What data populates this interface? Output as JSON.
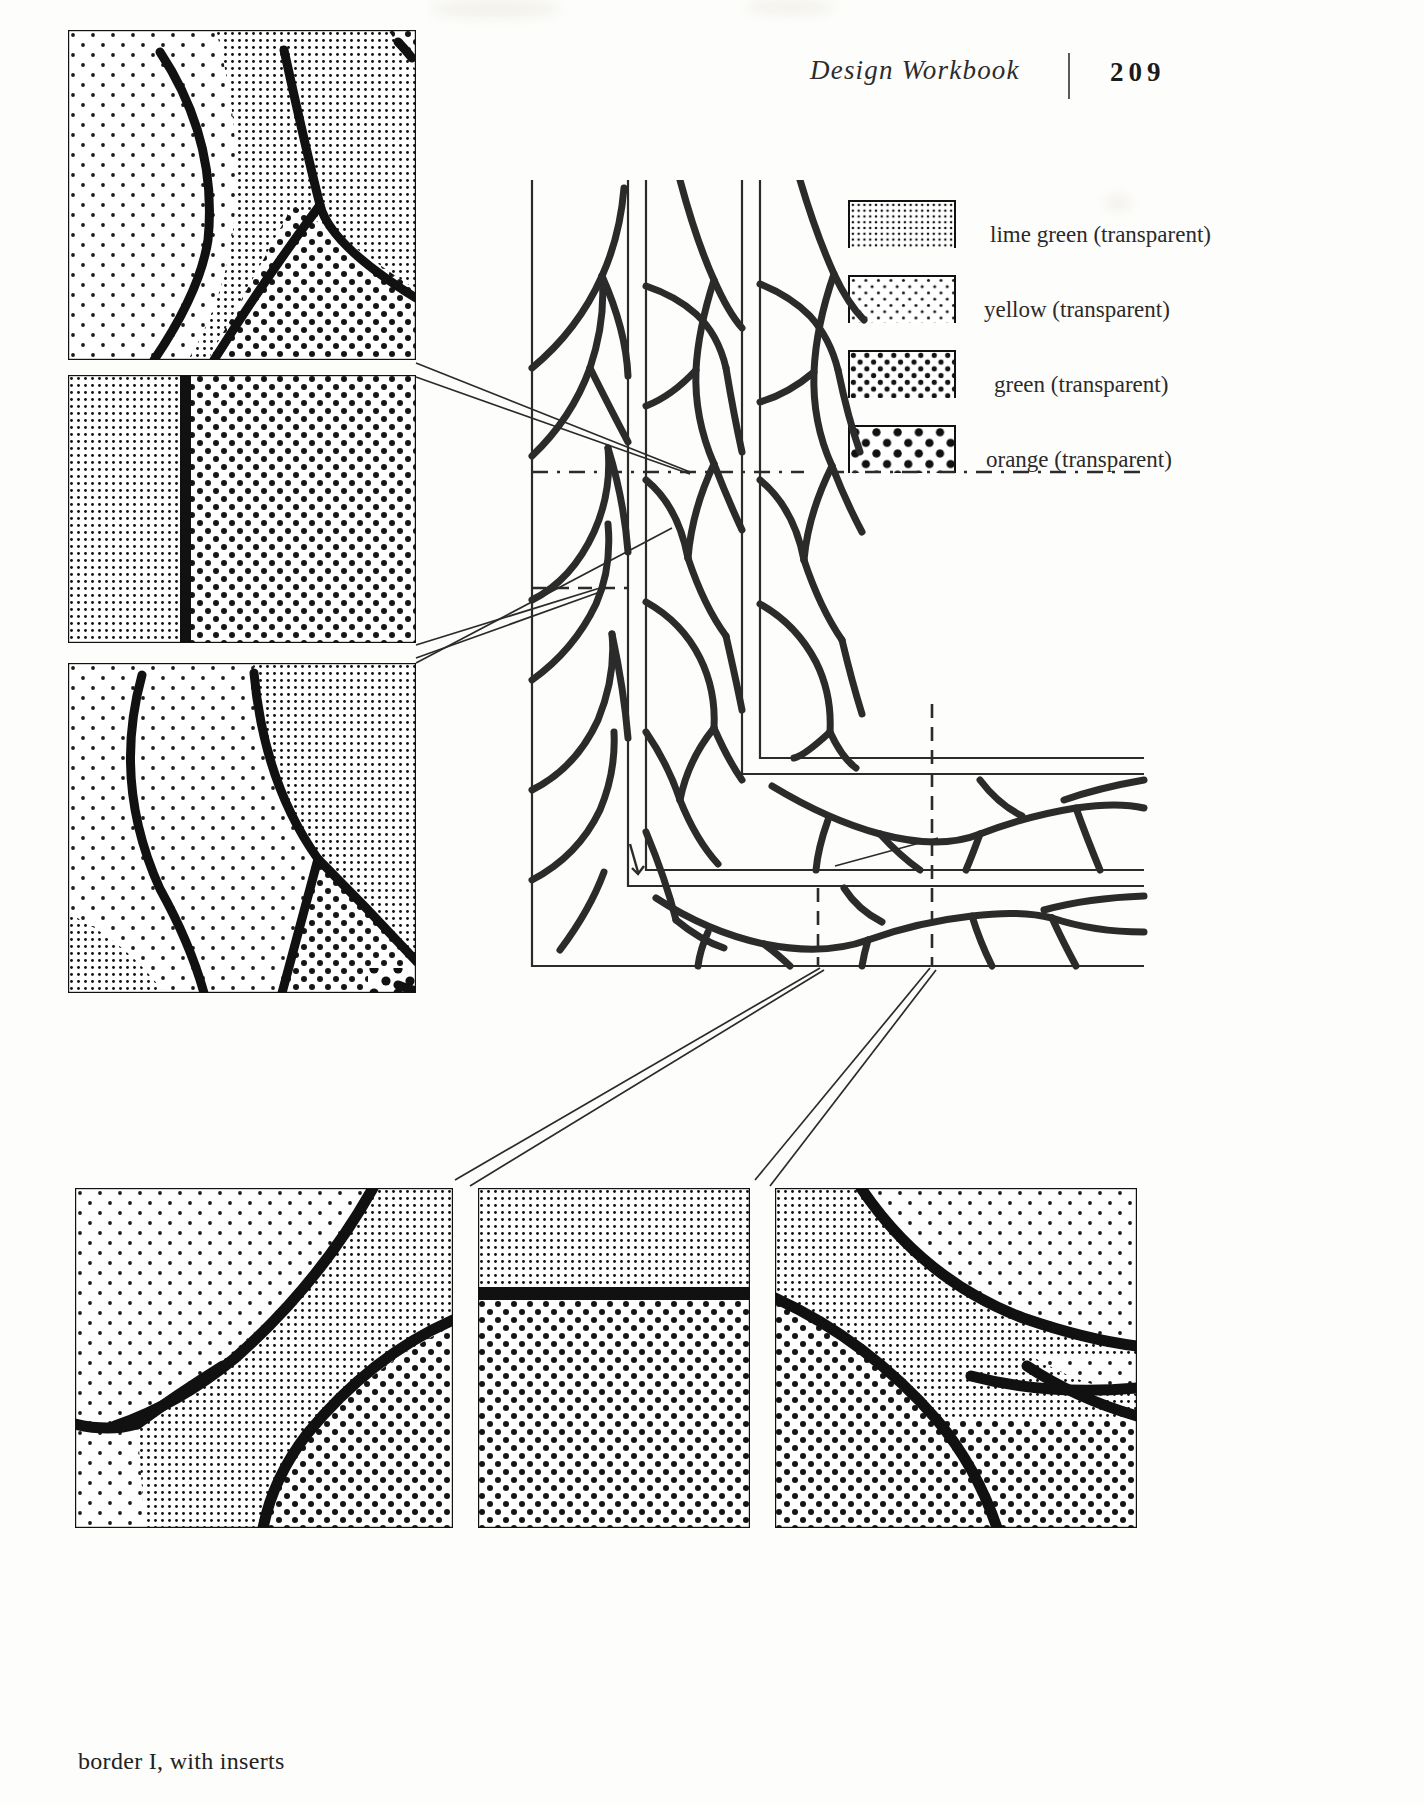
{
  "header": {
    "title": "Design Workbook",
    "divider": "vertical-rule",
    "page_number": "209"
  },
  "legend": {
    "items": [
      {
        "label": "lime green (transparent)",
        "swatch": "dense-fine-grid-dots",
        "color_name": "lime green",
        "modifier": "transparent"
      },
      {
        "label": "yellow (transparent)",
        "swatch": "sparse-small-dots",
        "color_name": "yellow",
        "modifier": "transparent"
      },
      {
        "label": "green (transparent)",
        "swatch": "medium-dots",
        "color_name": "green",
        "modifier": "transparent"
      },
      {
        "label": "orange (transparent)",
        "swatch": "large-sparse-dots",
        "color_name": "orange",
        "modifier": "transparent"
      }
    ]
  },
  "caption": "border I, with inserts",
  "figure": {
    "name": "border-I-with-inserts",
    "main_diagram": "L-shaped leaded glass border corner with concentric strips",
    "detail_panels": [
      {
        "id": "detail-top-left",
        "position": "upper-left",
        "fills": [
          "yellow",
          "lime green",
          "green"
        ]
      },
      {
        "id": "detail-mid-left",
        "position": "middle-left",
        "fills": [
          "lime green",
          "green"
        ]
      },
      {
        "id": "detail-lower-left",
        "position": "lower-left",
        "fills": [
          "yellow",
          "lime green",
          "green",
          "orange"
        ]
      },
      {
        "id": "detail-bottom-1",
        "position": "bottom-left",
        "fills": [
          "yellow",
          "lime green",
          "green"
        ]
      },
      {
        "id": "detail-bottom-2",
        "position": "bottom-center",
        "fills": [
          "lime green",
          "green"
        ]
      },
      {
        "id": "detail-bottom-3",
        "position": "bottom-right",
        "fills": [
          "lime green",
          "green",
          "yellow"
        ]
      }
    ],
    "section_lines": "dash-dot",
    "leader_lines": "thin paired callout lines"
  }
}
